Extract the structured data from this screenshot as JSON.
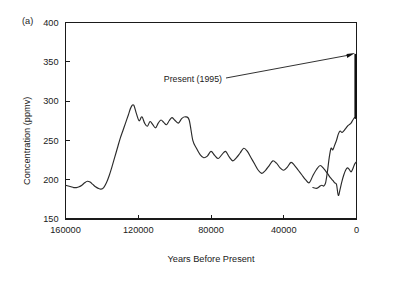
{
  "figure": {
    "panel_label": "(a)"
  },
  "chart_data": {
    "type": "line",
    "title": "",
    "xlabel": "Years Before Present",
    "ylabel": "Concentration (ppmv)",
    "xlim": [
      160000,
      0
    ],
    "ylim": [
      150,
      400
    ],
    "x_ticks": [
      160000,
      120000,
      80000,
      40000,
      0
    ],
    "x_tick_labels": [
      "160000",
      "120000",
      "80000",
      "40000",
      "0"
    ],
    "y_ticks": [
      150,
      200,
      250,
      300,
      350,
      400
    ],
    "y_tick_labels": [
      "150",
      "200",
      "250",
      "300",
      "350",
      "400"
    ],
    "x_axis_inverted": true,
    "grid": false,
    "legend": false,
    "series": [
      {
        "name": "Vostok ice core CO2",
        "x": [
          160000,
          158500,
          157000,
          155500,
          154000,
          152500,
          151000,
          149500,
          148000,
          146500,
          145000,
          143500,
          142000,
          140500,
          139000,
          137500,
          136000,
          134500,
          133000,
          131500,
          130000,
          128500,
          127000,
          125500,
          124000,
          122500,
          121000,
          119500,
          118000,
          116500,
          115000,
          113500,
          112000,
          110500,
          109000,
          107500,
          106000,
          104500,
          103000,
          101500,
          100000,
          98000,
          96000,
          94000,
          92000,
          90000,
          88000,
          86000,
          84000,
          82000,
          80000,
          78000,
          76000,
          74000,
          72000,
          70000,
          68000,
          66000,
          64000,
          62000,
          60000,
          58000,
          56000,
          54000,
          52000,
          50000,
          48000,
          46000,
          44000,
          42000,
          40000,
          38000,
          36000,
          34000,
          32000,
          30000,
          28000,
          26000,
          24000,
          22000,
          20000,
          18000,
          16000,
          14500,
          13000,
          12000,
          11000,
          10000,
          9000,
          8000,
          7000,
          6000,
          5000,
          4000,
          3000,
          2000,
          1000,
          0
        ],
        "y": [
          193,
          192,
          191,
          190,
          190,
          191,
          193,
          196,
          198,
          197,
          194,
          191,
          189,
          188,
          190,
          196,
          205,
          216,
          228,
          240,
          252,
          262,
          272,
          282,
          292,
          295,
          284,
          275,
          280,
          272,
          268,
          274,
          270,
          266,
          272,
          276,
          273,
          270,
          275,
          279,
          276,
          272,
          278,
          280,
          276,
          250,
          240,
          232,
          228,
          230,
          236,
          231,
          227,
          232,
          236,
          229,
          224,
          228,
          234,
          240,
          236,
          228,
          220,
          212,
          208,
          212,
          218,
          224,
          221,
          215,
          212,
          216,
          222,
          218,
          212,
          206,
          200,
          196,
          205,
          213,
          218,
          214,
          208,
          203,
          199,
          196,
          194,
          180,
          188,
          198,
          206,
          212,
          215,
          213,
          210,
          214,
          220,
          223
        ],
        "y_unit": "ppmv"
      }
    ],
    "extra_segments": [
      {
        "name": "holocene-and-modern-rise",
        "x": [
          24000,
          22000,
          21000,
          20000,
          19000,
          18000,
          17000,
          16000,
          15000,
          14000,
          13000,
          12000,
          11000,
          10000,
          9000,
          8000,
          7000,
          6000,
          5000,
          4000,
          3000,
          2000,
          1000,
          500,
          0
        ],
        "y": [
          190,
          189,
          190,
          192,
          193,
          192,
          196,
          210,
          228,
          240,
          238,
          244,
          250,
          258,
          262,
          260,
          262,
          265,
          268,
          270,
          272,
          276,
          279,
          278,
          278
        ]
      }
    ],
    "present_day_bar": {
      "label": "Present (1995)",
      "x": 0,
      "y_from": 278,
      "y_to": 360
    },
    "annotations": [
      {
        "text": "Present (1995)",
        "points_to_x": 0,
        "points_to_y": 360
      }
    ]
  }
}
